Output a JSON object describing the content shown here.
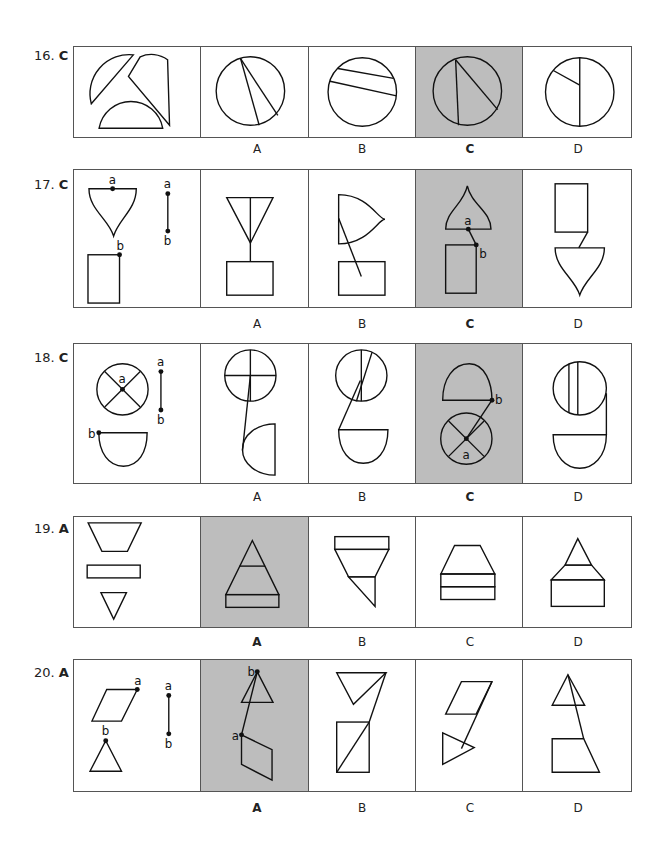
{
  "questions": [
    {
      "number": "16.",
      "answer": "C",
      "options": [
        "A",
        "B",
        "C",
        "D"
      ],
      "selected": "C"
    },
    {
      "number": "17.",
      "answer": "C",
      "options": [
        "A",
        "B",
        "C",
        "D"
      ],
      "selected": "C",
      "point_labels": [
        "a",
        "b"
      ]
    },
    {
      "number": "18.",
      "answer": "C",
      "options": [
        "A",
        "B",
        "C",
        "D"
      ],
      "selected": "C",
      "point_labels": [
        "a",
        "b"
      ]
    },
    {
      "number": "19.",
      "answer": "A",
      "options": [
        "A",
        "B",
        "C",
        "D"
      ],
      "selected": "A"
    },
    {
      "number": "20.",
      "answer": "A",
      "options": [
        "A",
        "B",
        "C",
        "D"
      ],
      "selected": "A",
      "point_labels": [
        "a",
        "b"
      ]
    }
  ],
  "colors": {
    "selected_fill": "#bdbdbd",
    "stroke": "#111111"
  }
}
